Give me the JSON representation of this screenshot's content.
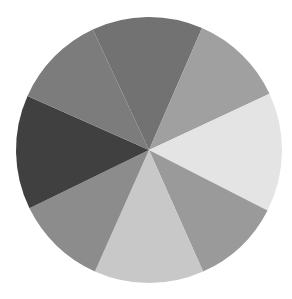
{
  "chart_data": {
    "type": "pie",
    "title": "",
    "legend": [],
    "labels_shown": false,
    "center": [
      149,
      150
    ],
    "radius": 133,
    "start_angle_deg": 245,
    "direction": "clockwise",
    "slices": [
      {
        "name": "slice-1-top",
        "value": 13.5,
        "angle_deg": 48.5,
        "color": "#727272"
      },
      {
        "name": "slice-2-upper-right",
        "value": 11.5,
        "angle_deg": 41.5,
        "color": "#a0a0a0"
      },
      {
        "name": "slice-3-right",
        "value": 14.4,
        "angle_deg": 52,
        "color": "#e4e4e4"
      },
      {
        "name": "slice-4-lower-right",
        "value": 10.8,
        "angle_deg": 39,
        "color": "#9a9a9a"
      },
      {
        "name": "slice-5-bottom",
        "value": 13.3,
        "angle_deg": 48,
        "color": "#c8c8c8"
      },
      {
        "name": "slice-6-lower-left",
        "value": 11.1,
        "angle_deg": 40,
        "color": "#8c8c8c"
      },
      {
        "name": "slice-7-left",
        "value": 13.9,
        "angle_deg": 50,
        "color": "#404040"
      },
      {
        "name": "slice-8-upper-left",
        "value": 11.4,
        "angle_deg": 41,
        "color": "#7c7c7c"
      }
    ],
    "values": [
      13.5,
      11.5,
      14.4,
      10.8,
      13.3,
      11.1,
      13.9,
      11.4
    ],
    "categories": [
      "1",
      "2",
      "3",
      "4",
      "5",
      "6",
      "7",
      "8"
    ]
  }
}
